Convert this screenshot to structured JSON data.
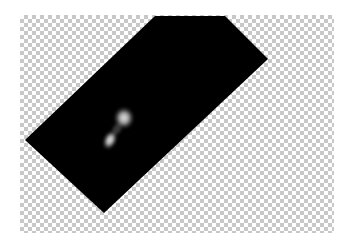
{
  "image": {
    "description": "Rotated dark astronomical photo showing a faint glowing nebula pair, placed on a transparency checkerboard background",
    "background": {
      "type": "transparency-checkerboard",
      "light_color": "#ffffff",
      "dark_color": "#c8c8c8",
      "cell_size_px": 4
    },
    "photo": {
      "fill_color": "#000000",
      "shape": "rotated-rectangle",
      "corners": [
        [
          155,
          16
        ],
        [
          225,
          16
        ],
        [
          268,
          59
        ],
        [
          104,
          213
        ],
        [
          25,
          140
        ]
      ],
      "glow_color": "#d8d8d8",
      "objects": [
        {
          "name": "upper-glow",
          "cx": 124,
          "cy": 118,
          "rx": 9,
          "ry": 10
        },
        {
          "name": "lower-glow",
          "cx": 110,
          "cy": 140,
          "rx": 6,
          "ry": 9
        }
      ]
    }
  }
}
